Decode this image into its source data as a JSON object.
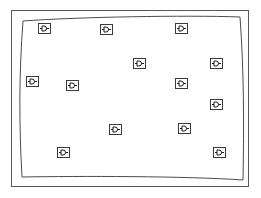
{
  "figure": {
    "background_color": "#ffffff",
    "width": 261,
    "height": 198
  },
  "outer_frame": {
    "name": "outer-frame",
    "stroke_color": "#58585a",
    "stroke_width": 1,
    "x": 11,
    "y": 10,
    "width": 238,
    "height": 177
  },
  "deployment_region": {
    "name": "deployment-region-boundary",
    "stroke_color": "#4c4c4e",
    "stroke_width": 1,
    "fill": "none",
    "shape": "bowed-quadrilateral",
    "corners": [
      {
        "x": 23,
        "y": 21
      },
      {
        "x": 240,
        "y": 17
      },
      {
        "x": 243,
        "y": 180
      },
      {
        "x": 22,
        "y": 177
      }
    ],
    "edge_curvature": "slightly bowed outward"
  },
  "node_icon": {
    "name": "sensor-node-icon",
    "glyph": "device-node-icon",
    "description": "square outline enclosing a D-shaped semicircle with a horizontal lead extending right",
    "box_stroke_color": "#3a3a3c",
    "glyph_stroke_color": "#1c1c1e",
    "box_fill": "#ffffff",
    "width": 13,
    "height": 11,
    "count": 14
  },
  "nodes": [
    {
      "id": "node-1",
      "label": "Sensor node 1",
      "x": 38,
      "y": 23
    },
    {
      "id": "node-2",
      "label": "Sensor node 2",
      "x": 100,
      "y": 24
    },
    {
      "id": "node-3",
      "label": "Sensor node 3",
      "x": 175,
      "y": 23
    },
    {
      "id": "node-4",
      "label": "Sensor node 4",
      "x": 133,
      "y": 58
    },
    {
      "id": "node-5",
      "label": "Sensor node 5",
      "x": 210,
      "y": 58
    },
    {
      "id": "node-6",
      "label": "Sensor node 6",
      "x": 26,
      "y": 76
    },
    {
      "id": "node-7",
      "label": "Sensor node 7",
      "x": 66,
      "y": 80
    },
    {
      "id": "node-8",
      "label": "Sensor node 8",
      "x": 175,
      "y": 78
    },
    {
      "id": "node-9",
      "label": "Sensor node 9",
      "x": 210,
      "y": 99
    },
    {
      "id": "node-10",
      "label": "Sensor node 10",
      "x": 109,
      "y": 124
    },
    {
      "id": "node-11",
      "label": "Sensor node 11",
      "x": 178,
      "y": 123
    },
    {
      "id": "node-12",
      "label": "Sensor node 12",
      "x": 57,
      "y": 147
    },
    {
      "id": "node-13",
      "label": "Sensor node 13",
      "x": 213,
      "y": 147
    },
    {
      "id": "node-14",
      "label": "Sensor node 14",
      "x": 210,
      "y": 100
    }
  ]
}
